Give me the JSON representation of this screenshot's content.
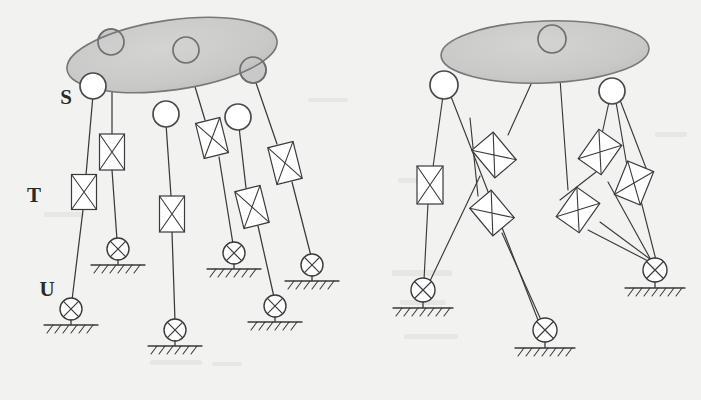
{
  "figure": {
    "background_color": "#f2f2f0",
    "ink_color": "#3a3a3a",
    "platform_fill": "#c9c9c9",
    "platform_stroke": "#787878"
  },
  "labels": [
    {
      "id": "S",
      "text": "S",
      "meaning": "spherical-joint",
      "x": 66,
      "y": 104
    },
    {
      "id": "T",
      "text": "T",
      "meaning": "prismatic-actuator",
      "x": 34,
      "y": 202
    },
    {
      "id": "U",
      "text": "U",
      "meaning": "universal-joint",
      "x": 47,
      "y": 296
    }
  ],
  "diagrams": [
    {
      "id": "left-manipulator",
      "name": "six-limb-parallel-manipulator",
      "limb_count": 6,
      "platform": {
        "cx": 172,
        "cy": 55,
        "rx": 106,
        "ry": 35,
        "rotation": -8
      },
      "spherical_joints": [
        {
          "id": "S1",
          "x": 93,
          "y": 86,
          "depth": "front"
        },
        {
          "id": "S2",
          "x": 111,
          "y": 42,
          "depth": "back"
        },
        {
          "id": "S3",
          "x": 166,
          "y": 114,
          "depth": "front"
        },
        {
          "id": "S4",
          "x": 186,
          "y": 50,
          "depth": "back"
        },
        {
          "id": "S5",
          "x": 238,
          "y": 117,
          "depth": "front"
        },
        {
          "id": "S6",
          "x": 253,
          "y": 70,
          "depth": "back"
        }
      ],
      "actuators": [
        {
          "id": "T1",
          "cx": 84,
          "cy": 192,
          "w": 25,
          "h": 35,
          "angle": 0
        },
        {
          "id": "T2",
          "cx": 112,
          "cy": 152,
          "w": 25,
          "h": 36,
          "angle": 0
        },
        {
          "id": "T3",
          "cx": 172,
          "cy": 214,
          "w": 25,
          "h": 36,
          "angle": 0
        },
        {
          "id": "T4",
          "cx": 212,
          "cy": 138,
          "w": 25,
          "h": 36,
          "angle": -14
        },
        {
          "id": "T5",
          "cx": 252,
          "cy": 207,
          "w": 26,
          "h": 38,
          "angle": -14
        },
        {
          "id": "T6",
          "cx": 285,
          "cy": 163,
          "w": 26,
          "h": 38,
          "angle": -14
        }
      ],
      "universal_joints": [
        {
          "id": "U1",
          "x": 71,
          "y": 309,
          "ground_y": 325
        },
        {
          "id": "U2",
          "x": 118,
          "y": 249,
          "ground_y": 265
        },
        {
          "id": "U3",
          "x": 175,
          "y": 330,
          "ground_y": 346
        },
        {
          "id": "U4",
          "x": 234,
          "y": 253,
          "ground_y": 269
        },
        {
          "id": "U5",
          "x": 275,
          "y": 306,
          "ground_y": 322
        },
        {
          "id": "U6",
          "x": 312,
          "y": 265,
          "ground_y": 281
        }
      ]
    },
    {
      "id": "right-manipulator",
      "name": "three-limb-parallel-manipulator",
      "limb_count": 6,
      "platform": {
        "cx": 545,
        "cy": 52,
        "rx": 104,
        "ry": 31,
        "rotation": -2
      },
      "spherical_joints": [
        {
          "id": "S1",
          "x": 444,
          "y": 85,
          "depth": "front"
        },
        {
          "id": "S2",
          "x": 552,
          "y": 39,
          "depth": "back"
        },
        {
          "id": "S3",
          "x": 612,
          "y": 91,
          "depth": "front"
        }
      ],
      "actuators": [
        {
          "id": "T1",
          "cx": 430,
          "cy": 185,
          "w": 26,
          "h": 38,
          "angle": 0
        },
        {
          "id": "T2",
          "cx": 494,
          "cy": 155,
          "w": 28,
          "h": 36,
          "angle": -40
        },
        {
          "id": "T3",
          "cx": 492,
          "cy": 213,
          "w": 28,
          "h": 36,
          "angle": -40
        },
        {
          "id": "T4",
          "cx": 600,
          "cy": 152,
          "w": 28,
          "h": 36,
          "angle": 35
        },
        {
          "id": "T5",
          "cx": 634,
          "cy": 183,
          "w": 28,
          "h": 36,
          "angle": 22
        },
        {
          "id": "T6",
          "cx": 578,
          "cy": 210,
          "w": 28,
          "h": 36,
          "angle": 35
        }
      ],
      "universal_joints": [
        {
          "id": "U1",
          "x": 423,
          "y": 290,
          "ground_y": 308
        },
        {
          "id": "U2",
          "x": 545,
          "y": 330,
          "ground_y": 348
        },
        {
          "id": "U3",
          "x": 655,
          "y": 270,
          "ground_y": 288
        }
      ]
    }
  ],
  "legend": {
    "S": "spherical joint (open circle)",
    "T": "linear actuator / prismatic pair (rectangle with crossed diagonals)",
    "U": "universal joint on fixed base (circle with cross, hatched ground)"
  }
}
